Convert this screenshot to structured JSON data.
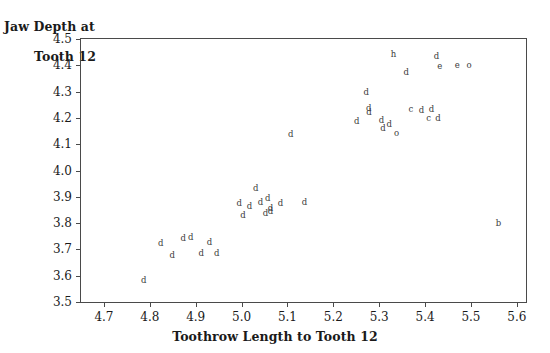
{
  "chart_data": {
    "type": "scatter",
    "title": "",
    "xlabel": "Toothrow Length to Tooth 12",
    "ylabel": "Jaw Depth at\nTooth 12",
    "ylabel_line1": "Jaw Depth at",
    "ylabel_line2": "Tooth 12",
    "xlim": [
      4.65,
      5.62
    ],
    "ylim": [
      3.5,
      4.5
    ],
    "grid": false,
    "legend": "none",
    "xticks": [
      "4.7",
      "4.8",
      "4.9",
      "5.0",
      "5.1",
      "5.2",
      "5.3",
      "5.4",
      "5.5",
      "5.6"
    ],
    "xtick_values": [
      4.7,
      4.8,
      4.9,
      5.0,
      5.1,
      5.2,
      5.3,
      5.4,
      5.5,
      5.6
    ],
    "yticks": [
      "4.5",
      "4.4",
      "4.3",
      "4.2",
      "4.1",
      "4.0",
      "3.9",
      "3.8",
      "3.7",
      "3.6",
      "3.5"
    ],
    "ytick_values": [
      4.5,
      4.4,
      4.3,
      4.2,
      4.1,
      4.0,
      3.9,
      3.8,
      3.7,
      3.6,
      3.5
    ],
    "marker_style": "letter-glyph",
    "marker_letters": [
      "d",
      "c",
      "e",
      "o",
      "h",
      "b"
    ],
    "points": [
      {
        "x": 4.787,
        "y": 3.583,
        "label": "d"
      },
      {
        "x": 4.824,
        "y": 3.723,
        "label": "d"
      },
      {
        "x": 4.849,
        "y": 3.678,
        "label": "d"
      },
      {
        "x": 4.873,
        "y": 3.744,
        "label": "d"
      },
      {
        "x": 4.889,
        "y": 3.746,
        "label": "d"
      },
      {
        "x": 4.912,
        "y": 3.688,
        "label": "d"
      },
      {
        "x": 4.93,
        "y": 3.728,
        "label": "d"
      },
      {
        "x": 4.946,
        "y": 3.686,
        "label": "d"
      },
      {
        "x": 4.995,
        "y": 3.878,
        "label": "d"
      },
      {
        "x": 5.003,
        "y": 3.832,
        "label": "d"
      },
      {
        "x": 5.017,
        "y": 3.864,
        "label": "d"
      },
      {
        "x": 5.031,
        "y": 3.935,
        "label": "d"
      },
      {
        "x": 5.041,
        "y": 3.879,
        "label": "d"
      },
      {
        "x": 5.052,
        "y": 3.838,
        "label": "d"
      },
      {
        "x": 5.057,
        "y": 3.897,
        "label": "d"
      },
      {
        "x": 5.063,
        "y": 3.858,
        "label": "d"
      },
      {
        "x": 5.063,
        "y": 3.846,
        "label": "d"
      },
      {
        "x": 5.085,
        "y": 3.878,
        "label": "d"
      },
      {
        "x": 5.107,
        "y": 4.139,
        "label": "d"
      },
      {
        "x": 5.137,
        "y": 3.879,
        "label": "d"
      },
      {
        "x": 5.251,
        "y": 4.187,
        "label": "d"
      },
      {
        "x": 5.272,
        "y": 4.3,
        "label": "d"
      },
      {
        "x": 5.277,
        "y": 4.238,
        "label": "d"
      },
      {
        "x": 5.278,
        "y": 4.222,
        "label": "d"
      },
      {
        "x": 5.305,
        "y": 4.193,
        "label": "d"
      },
      {
        "x": 5.308,
        "y": 4.163,
        "label": "d"
      },
      {
        "x": 5.322,
        "y": 4.178,
        "label": "d"
      },
      {
        "x": 5.331,
        "y": 4.444,
        "label": "h"
      },
      {
        "x": 5.338,
        "y": 4.143,
        "label": "o"
      },
      {
        "x": 5.359,
        "y": 4.376,
        "label": "d"
      },
      {
        "x": 5.369,
        "y": 4.232,
        "label": "c"
      },
      {
        "x": 5.392,
        "y": 4.231,
        "label": "d"
      },
      {
        "x": 5.408,
        "y": 4.2,
        "label": "c"
      },
      {
        "x": 5.414,
        "y": 4.232,
        "label": "d"
      },
      {
        "x": 5.425,
        "y": 4.436,
        "label": "d"
      },
      {
        "x": 5.428,
        "y": 4.2,
        "label": "d"
      },
      {
        "x": 5.432,
        "y": 4.398,
        "label": "e"
      },
      {
        "x": 5.47,
        "y": 4.4,
        "label": "e"
      },
      {
        "x": 5.496,
        "y": 4.4,
        "label": "o"
      },
      {
        "x": 5.56,
        "y": 3.8,
        "label": "b"
      }
    ]
  }
}
